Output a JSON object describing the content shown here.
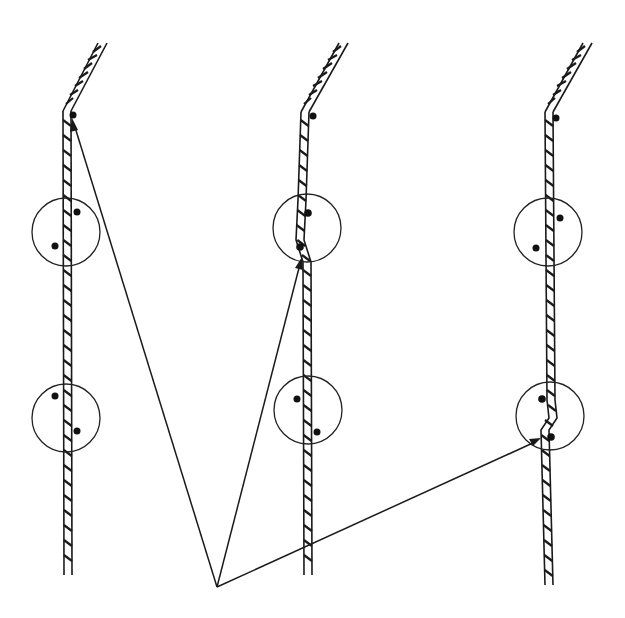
{
  "diagram": {
    "colors": {
      "line": "#1a1a1a",
      "background": "#ffffff"
    },
    "origin": {
      "x": 217,
      "y": 587
    },
    "strands": [
      {
        "id": "strand-left",
        "kink": false,
        "top_dot": {
          "x": 73,
          "y": 115
        },
        "circles": [
          {
            "cx": 66,
            "cy": 232,
            "r": 34,
            "dots": [
              [
                77,
                212
              ],
              [
                55,
                246
              ]
            ]
          },
          {
            "cx": 66,
            "cy": 418,
            "r": 34,
            "dots": [
              [
                55,
                396
              ],
              [
                77,
                431
              ]
            ]
          }
        ],
        "arrow_target": {
          "x": 72,
          "y": 120
        }
      },
      {
        "id": "strand-middle",
        "kink": true,
        "top_dot": {
          "x": 313,
          "y": 116
        },
        "circles": [
          {
            "cx": 307,
            "cy": 228,
            "r": 34,
            "dots": [
              [
                308,
                212
              ],
              [
                300,
                247
              ]
            ]
          },
          {
            "cx": 308,
            "cy": 410,
            "r": 34,
            "dots": [
              [
                297,
                399
              ],
              [
                317,
                432
              ]
            ]
          }
        ],
        "arrow_target": {
          "x": 301,
          "y": 260
        }
      },
      {
        "id": "strand-right",
        "kink": true,
        "top_dot": {
          "x": 554,
          "y": 118
        },
        "circles": [
          {
            "cx": 548,
            "cy": 232,
            "r": 34,
            "dots": [
              [
                560,
                218
              ],
              [
                536,
                248
              ]
            ]
          },
          {
            "cx": 550,
            "cy": 416,
            "r": 34,
            "dots": [
              [
                542,
                399
              ],
              [
                551,
                437
              ]
            ]
          }
        ],
        "arrow_target": {
          "x": 537,
          "y": 440
        }
      }
    ]
  }
}
